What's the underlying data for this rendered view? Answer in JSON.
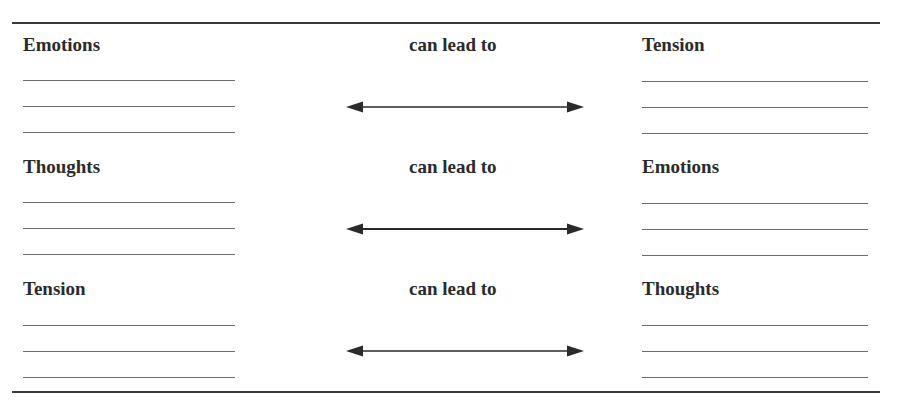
{
  "worksheet": {
    "connector_label": "can lead to",
    "blank_lines_per_cell": 3,
    "rows": [
      {
        "left_label": "Emotions",
        "connector": "can lead to",
        "right_label": "Tension"
      },
      {
        "left_label": "Thoughts",
        "connector": "can lead to",
        "right_label": "Emotions"
      },
      {
        "left_label": "Tension",
        "connector": "can lead to",
        "right_label": "Thoughts"
      }
    ]
  },
  "colors": {
    "text": "#2b2b2b",
    "rule": "#3a3a3a",
    "blank_line": "#6d6d6d",
    "arrow": "#2a2a2a"
  }
}
